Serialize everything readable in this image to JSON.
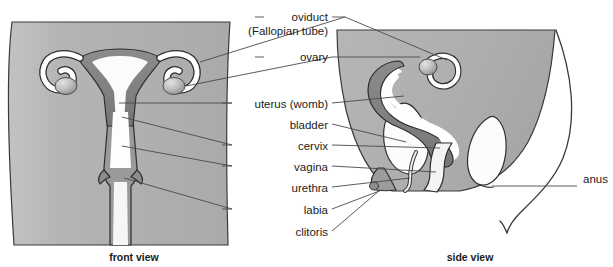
{
  "figure": {
    "colors": {
      "background": "#ffffff",
      "body_fill": "#b3b3b3",
      "body_fill_side": "#b0b0b0",
      "organ_dark": "#7f7f7f",
      "organ_light": "#ffffff",
      "outline": "#3a3a3a",
      "leader_line": "#4a4a4a",
      "text": "#1c1c1c"
    }
  },
  "labels": [
    {
      "id": "oviduct",
      "text": "oviduct",
      "x": 328,
      "y": 17,
      "align": "end"
    },
    {
      "id": "fallopian",
      "text": "(Fallopian tube)",
      "x": 328,
      "y": 31,
      "align": "end"
    },
    {
      "id": "ovary",
      "text": "ovary",
      "x": 328,
      "y": 57,
      "align": "end"
    },
    {
      "id": "uterus",
      "text": "uterus (womb)",
      "x": 328,
      "y": 105,
      "align": "end"
    },
    {
      "id": "bladder",
      "text": "bladder",
      "x": 328,
      "y": 126,
      "align": "end"
    },
    {
      "id": "cervix",
      "text": "cervix",
      "x": 328,
      "y": 147,
      "align": "end"
    },
    {
      "id": "vagina",
      "text": "vagina",
      "x": 328,
      "y": 168,
      "align": "end"
    },
    {
      "id": "urethra",
      "text": "urethra",
      "x": 328,
      "y": 189,
      "align": "end"
    },
    {
      "id": "labia",
      "text": "labia",
      "x": 328,
      "y": 211,
      "align": "end"
    },
    {
      "id": "clitoris",
      "text": "clitoris",
      "x": 328,
      "y": 233,
      "align": "end"
    },
    {
      "id": "anus",
      "text": "anus",
      "x": 583,
      "y": 180,
      "align": "start"
    }
  ],
  "captions": [
    {
      "id": "front-view",
      "text": "front view",
      "x": 134,
      "y": 261
    },
    {
      "id": "side-view",
      "text": "side view",
      "x": 470,
      "y": 261
    }
  ],
  "views": {
    "front": {
      "name": "front view",
      "structures": [
        "uterus",
        "oviduct",
        "ovary",
        "cervix",
        "vagina",
        "labia"
      ]
    },
    "side": {
      "name": "side view",
      "structures": [
        "uterus",
        "oviduct",
        "ovary",
        "bladder",
        "cervix",
        "vagina",
        "urethra",
        "labia",
        "clitoris",
        "anus",
        "rectum"
      ]
    }
  }
}
